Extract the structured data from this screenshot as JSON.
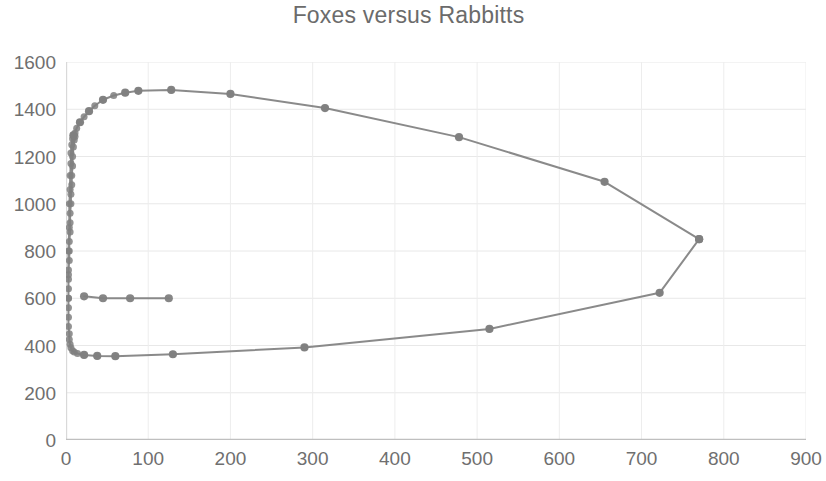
{
  "chart": {
    "title": "Foxes versus Rabbitts"
  },
  "chart_data": {
    "type": "scatter",
    "title": "Foxes versus Rabbitts",
    "xlabel": "",
    "ylabel": "",
    "xlim": [
      0,
      900
    ],
    "ylim": [
      0,
      1600
    ],
    "xticks": [
      0,
      100,
      200,
      300,
      400,
      500,
      600,
      700,
      800,
      900
    ],
    "yticks": [
      0,
      200,
      400,
      600,
      800,
      1000,
      1200,
      1400,
      1600
    ],
    "grid": true,
    "legend": false,
    "legend_position": "none",
    "series": [
      {
        "name": "Foxes versus Rabbitts",
        "mode": "lines+markers",
        "color": "#808080",
        "marker_color": "#808080",
        "marker_size": 7,
        "line_width": 2,
        "points": [
          [
            3,
            600
          ],
          [
            3,
            700
          ],
          [
            3,
            800
          ],
          [
            4,
            900
          ],
          [
            4,
            1000
          ],
          [
            5,
            1060
          ],
          [
            5,
            1120
          ],
          [
            6,
            1170
          ],
          [
            6,
            1215
          ],
          [
            7,
            1250
          ],
          [
            8,
            1275
          ],
          [
            9,
            1290
          ],
          [
            11,
            1300
          ],
          [
            13,
            1320
          ],
          [
            17,
            1345
          ],
          [
            22,
            1368
          ],
          [
            28,
            1392
          ],
          [
            35,
            1415
          ],
          [
            45,
            1440
          ],
          [
            58,
            1458
          ],
          [
            72,
            1470
          ],
          [
            88,
            1478
          ],
          [
            128,
            1482
          ],
          [
            200,
            1465
          ],
          [
            315,
            1405
          ],
          [
            478,
            1282
          ],
          [
            655,
            1093
          ],
          [
            770,
            850
          ],
          [
            722,
            623
          ],
          [
            515,
            470
          ],
          [
            290,
            392
          ],
          [
            130,
            363
          ],
          [
            60,
            355
          ],
          [
            38,
            356
          ],
          [
            22,
            360
          ],
          [
            14,
            366
          ],
          [
            10,
            372
          ],
          [
            8,
            378
          ],
          [
            6,
            390
          ],
          [
            5,
            405
          ],
          [
            4,
            425
          ],
          [
            4,
            450
          ],
          [
            3,
            480
          ],
          [
            3,
            520
          ],
          [
            3,
            560
          ],
          [
            3,
            600
          ],
          [
            3,
            640
          ],
          [
            3,
            680
          ],
          [
            3,
            720
          ],
          [
            4,
            760
          ],
          [
            4,
            800
          ],
          [
            4,
            840
          ],
          [
            5,
            880
          ],
          [
            5,
            920
          ],
          [
            5,
            960
          ],
          [
            6,
            1000
          ],
          [
            6,
            1040
          ],
          [
            7,
            1080
          ],
          [
            7,
            1120
          ],
          [
            8,
            1160
          ],
          [
            8,
            1200
          ],
          [
            9,
            1240
          ],
          [
            10,
            1270
          ],
          [
            11,
            1285
          ]
        ],
        "branch_upper_markers": [
          [
            9,
            1290
          ],
          [
            17,
            1345
          ],
          [
            28,
            1392
          ],
          [
            45,
            1440
          ],
          [
            72,
            1470
          ],
          [
            88,
            1478
          ],
          [
            128,
            1482
          ],
          [
            200,
            1465
          ],
          [
            315,
            1405
          ],
          [
            478,
            1282
          ],
          [
            655,
            1093
          ],
          [
            770,
            850
          ]
        ],
        "branch_lower_markers": [
          [
            770,
            850
          ],
          [
            722,
            623
          ],
          [
            515,
            470
          ],
          [
            290,
            392
          ],
          [
            130,
            363
          ],
          [
            60,
            355
          ],
          [
            38,
            356
          ],
          [
            22,
            360
          ]
        ],
        "mid_shelf_markers": [
          [
            22,
            608
          ],
          [
            45,
            600
          ],
          [
            78,
            600
          ],
          [
            125,
            600
          ]
        ],
        "notes": "Closed predator-prey (Lotka-Volterra) phase-plane orbit; dense marker cluster hugs the left axis near x=0 spanning y from about 360 to 1290."
      }
    ]
  }
}
